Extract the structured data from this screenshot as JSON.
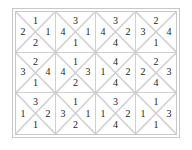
{
  "puzzle": {
    "rows": 3,
    "cols": 4,
    "tiles": [
      [
        {
          "top": "1",
          "left": "2",
          "right": "1",
          "bottom": "2"
        },
        {
          "top": "3",
          "left": "4",
          "right": "1",
          "bottom": "1"
        },
        {
          "top": "3",
          "left": "4",
          "right": "2",
          "bottom": "4"
        },
        {
          "top": "2",
          "left": "3",
          "right": "4",
          "bottom": "1"
        }
      ],
      [
        {
          "top": "2",
          "left": "3",
          "right": "4",
          "bottom": "1"
        },
        {
          "top": "1",
          "left": "4",
          "right": "3",
          "bottom": "2"
        },
        {
          "top": "4",
          "left": "1",
          "right": "2",
          "bottom": "4"
        },
        {
          "top": "2",
          "left": "2",
          "right": "3",
          "bottom": "4"
        }
      ],
      [
        {
          "top": "3",
          "left": "1",
          "right": "2",
          "bottom": "1"
        },
        {
          "top": "1",
          "left": "3",
          "right": "1",
          "bottom": "2"
        },
        {
          "top": "3",
          "left": "1",
          "right": "2",
          "bottom": "4"
        },
        {
          "top": "1",
          "left": "1",
          "right": "3",
          "bottom": "1"
        }
      ]
    ]
  }
}
